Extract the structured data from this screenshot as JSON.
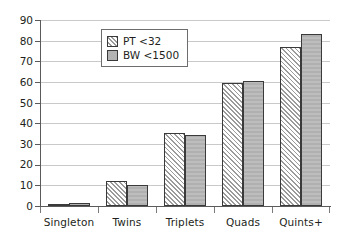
{
  "chart_data": {
    "type": "bar",
    "title": "",
    "subtitle": "",
    "xlabel": "",
    "ylabel": "",
    "categories": [
      "Singleton",
      "Twins",
      "Triplets",
      "Quads",
      "Quints+"
    ],
    "series": [
      {
        "name": "PT <32",
        "values": [
          1,
          12,
          35.5,
          59.5,
          77
        ]
      },
      {
        "name": "BW <1500",
        "values": [
          1.5,
          10,
          34.5,
          60.5,
          83
        ]
      }
    ],
    "ylim": [
      0,
      90
    ],
    "ytick_step": 10,
    "yticks": [
      0,
      10,
      20,
      30,
      40,
      50,
      60,
      70,
      80,
      90
    ],
    "ytick_labels": [
      "0",
      "10",
      "20",
      "30",
      "40",
      "50",
      "60",
      "70",
      "80",
      "90"
    ],
    "grid": true,
    "grid_axis": "y",
    "legend_position": "upper center",
    "legend": [
      "PT <32",
      "BW <1500"
    ],
    "colors": {
      "pt_fill": "#ffffff",
      "pt_hatch": "#9b9b9b",
      "bw_fill": "#b3b3b3",
      "bar_edge": "#3a3a3a",
      "gridline": "#c9c9c9",
      "axis": "#5a5a5a",
      "text": "#231f20"
    }
  }
}
